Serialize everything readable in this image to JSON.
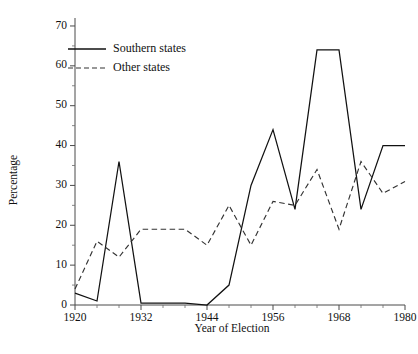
{
  "chart_data": {
    "type": "line",
    "title": "",
    "xlabel": "Year of Election",
    "ylabel": "Percentage",
    "xlim": [
      1920,
      1980
    ],
    "ylim": [
      0,
      72
    ],
    "grid": false,
    "legend_position": "upper-left-inside",
    "x": [
      1920,
      1924,
      1928,
      1932,
      1936,
      1940,
      1944,
      1948,
      1952,
      1956,
      1960,
      1964,
      1968,
      1972,
      1976,
      1980
    ],
    "xticks_major": [
      1920,
      1932,
      1944,
      1956,
      1968,
      1980
    ],
    "xticks_major_labels": [
      "1920",
      "1932",
      "1944",
      "1956",
      "1968",
      "1980"
    ],
    "xticks_minor": [
      1924,
      1928,
      1936,
      1940,
      1948,
      1952,
      1960,
      1964,
      1972,
      1976
    ],
    "yticks_major": [
      0,
      10,
      20,
      30,
      40,
      50,
      60,
      70
    ],
    "yticks_major_labels": [
      "0",
      "10",
      "20",
      "30",
      "40",
      "50",
      "60",
      "70"
    ],
    "yticks_minor": [
      5,
      15,
      25,
      35,
      45,
      55,
      65
    ],
    "series": [
      {
        "name": "Southern states",
        "style": "solid",
        "color": "#111111",
        "values": [
          3,
          1,
          36,
          0.5,
          0.5,
          0.5,
          0,
          5,
          30,
          44,
          24,
          64,
          64,
          24,
          40,
          40
        ]
      },
      {
        "name": "Other states",
        "style": "dashed",
        "color": "#333333",
        "values": [
          4,
          16,
          12,
          19,
          19,
          19,
          15,
          25,
          15,
          26,
          25,
          34,
          19,
          36,
          28,
          31
        ]
      }
    ]
  },
  "legend": {
    "entries": [
      {
        "label": "Southern states",
        "style": "solid"
      },
      {
        "label": "Other states",
        "style": "dashed"
      }
    ]
  }
}
